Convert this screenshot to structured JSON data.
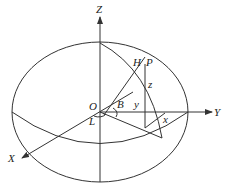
{
  "diagram": {
    "type": "geodetic coordinate ellipsoid",
    "labels": {
      "z_axis": "Z",
      "y_axis": "Y",
      "x_axis": "X",
      "origin": "O",
      "point_p": "P",
      "point_h": "H",
      "latitude": "B",
      "longitude": "L",
      "coord_x": "x",
      "coord_y": "y",
      "coord_z": "z"
    },
    "colors": {
      "stroke": "#333333",
      "text": "#222222",
      "background": "#ffffff"
    }
  }
}
